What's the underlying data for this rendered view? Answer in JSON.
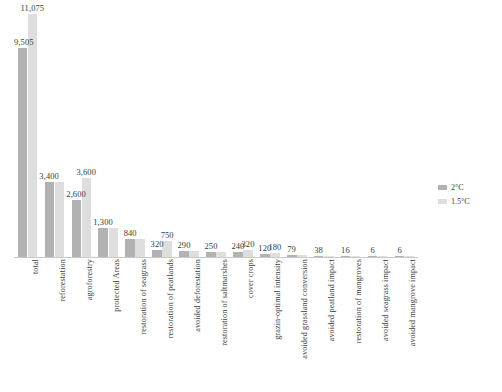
{
  "legend": {
    "position": "right",
    "items": [
      {
        "label": "2°C",
        "color": "#b2b2b2",
        "swatch_name": "legend-swatch-2c"
      },
      {
        "label": "1.5°C",
        "color": "#dedede",
        "swatch_name": "legend-swatch-15c"
      }
    ]
  },
  "chart_data": {
    "type": "bar",
    "title": "",
    "subtitle": "",
    "xlabel": "",
    "ylabel": "",
    "grid": false,
    "legend_position": "right",
    "ylim": [
      0,
      11075
    ],
    "categories": [
      "total",
      "reforestation",
      "agroforestry",
      "protected Areas",
      "restoration of seagrass",
      "restoration of peatlands",
      "avoided deforestation",
      "restoration of saltmarshes",
      "cover crops",
      "grazin-optimal intensity",
      "avoided grassland conversion",
      "avoided peatland impact",
      "restoration of mangroves",
      "avoided seagrass impact",
      "avoided mangrove impact"
    ],
    "series": [
      {
        "name": "2°C",
        "color": "#b2b2b2",
        "values": [
          9505,
          3400,
          2600,
          1300,
          840,
          320,
          290,
          250,
          240,
          120,
          79,
          38,
          16,
          6,
          6
        ]
      },
      {
        "name": "1.5°C",
        "color": "#dedede",
        "values": [
          11075,
          3400,
          3600,
          1300,
          840,
          750,
          290,
          250,
          320,
          180,
          79,
          38,
          16,
          6,
          6
        ]
      }
    ],
    "value_labels": [
      {
        "text": "9,505",
        "category": "total",
        "series": "2°C"
      },
      {
        "text": "11,075",
        "category": "total",
        "series": "1.5°C"
      },
      {
        "text": "3,400",
        "category": "reforestation",
        "series": "2°C"
      },
      {
        "text": "2,600",
        "category": "agroforestry",
        "series": "2°C"
      },
      {
        "text": "3,600",
        "category": "agroforestry",
        "series": "1.5°C"
      },
      {
        "text": "1,300",
        "category": "protected Areas",
        "series": "2°C"
      },
      {
        "text": "840",
        "category": "restoration of seagrass",
        "series": "2°C"
      },
      {
        "text": "320",
        "category": "restoration of peatlands",
        "series": "2°C"
      },
      {
        "text": "750",
        "category": "restoration of peatlands",
        "series": "1.5°C"
      },
      {
        "text": "290",
        "category": "avoided deforestation",
        "series": "2°C"
      },
      {
        "text": "250",
        "category": "restoration of saltmarshes",
        "series": "2°C"
      },
      {
        "text": "240",
        "category": "cover crops",
        "series": "2°C"
      },
      {
        "text": "320",
        "category": "cover crops",
        "series": "1.5°C"
      },
      {
        "text": "120",
        "category": "grazin-optimal intensity",
        "series": "2°C"
      },
      {
        "text": "180",
        "category": "grazin-optimal intensity",
        "series": "1.5°C"
      },
      {
        "text": "79",
        "category": "avoided grassland conversion",
        "series": "2°C"
      },
      {
        "text": "38",
        "category": "avoided peatland impact",
        "series": "2°C"
      },
      {
        "text": "16",
        "category": "restoration of mangroves",
        "series": "2°C"
      },
      {
        "text": "6",
        "category": "avoided seagrass impact",
        "series": "2°C"
      },
      {
        "text": "6",
        "category": "avoided mangrove impact",
        "series": "2°C"
      }
    ]
  }
}
